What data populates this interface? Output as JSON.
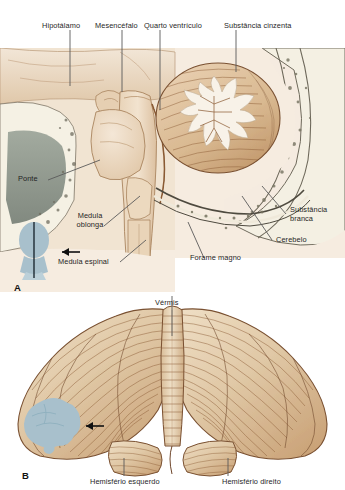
{
  "figure": {
    "language": "pt-BR"
  },
  "panels": [
    {
      "letter": "A",
      "name": "corte-sagital-mediano",
      "orientation_icon": "head-silhouette-icon",
      "arrow_icon": "arrow-left-icon",
      "labels": [
        {
          "id": "hipotalamo",
          "text": "Hipotálamo"
        },
        {
          "id": "mesencefalo",
          "text": "Mesencéfalo"
        },
        {
          "id": "quarto-ventriculo",
          "text": "Quarto ventrículo"
        },
        {
          "id": "substancia-cinzenta",
          "text": "Substância cinzenta"
        },
        {
          "id": "ponte",
          "text": "Ponte"
        },
        {
          "id": "medula-oblonga",
          "text": "Medula oblonga"
        },
        {
          "id": "medula-espinal",
          "text": "Medula espinal"
        },
        {
          "id": "forame-magno",
          "text": "Forame magno"
        },
        {
          "id": "substancia-branca",
          "text": "Substância branca"
        },
        {
          "id": "cerebelo",
          "text": "Cerebelo"
        }
      ]
    },
    {
      "letter": "B",
      "name": "vista-superior-cerebelo",
      "orientation_icon": "brain-silhouette-icon",
      "arrow_icon": "arrow-left-icon",
      "labels": [
        {
          "id": "vermis",
          "text": "Vérmis"
        },
        {
          "id": "hemisferio-esquerdo",
          "text": "Hemisfério esquerdo"
        },
        {
          "id": "hemisferio-direito",
          "text": "Hemisfério direito"
        }
      ]
    }
  ],
  "colors": {
    "background": "#ffffff",
    "tissue_light": "#efe0cd",
    "tissue_mid": "#e3cdb2",
    "tissue_deep": "#c9a57f",
    "folia_line": "#8a5a33",
    "outline": "#6e452a",
    "arbor_vitae": "#f6efe6",
    "bone_cortex": "#f3efe2",
    "bone_marrow_speck": "#7d7a6b",
    "sinus_cavity": "#7f8a80",
    "silhouette": "#a8c0cc",
    "leader_line": "#5a5a5a",
    "label_text": "#1f1f1f"
  }
}
